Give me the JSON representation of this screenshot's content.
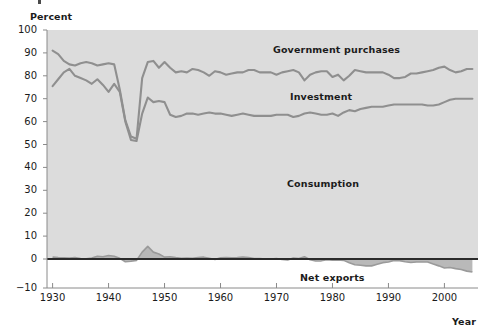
{
  "chart_data": {
    "type": "area",
    "title": "",
    "xlabel": "Year",
    "ylabel": "Percent",
    "xlim": [
      1929,
      2006
    ],
    "ylim": [
      -10,
      100
    ],
    "grid": false,
    "legend_position": "inline-annotations",
    "x_ticks": [
      1930,
      1940,
      1950,
      1960,
      1970,
      1980,
      1990,
      2000
    ],
    "y_ticks": [
      -10,
      0,
      10,
      20,
      30,
      40,
      50,
      60,
      70,
      80,
      90,
      100
    ],
    "annotations": [
      "Government purchases",
      "Investment",
      "Consumption",
      "Net exports"
    ],
    "x": [
      1930,
      1931,
      1932,
      1933,
      1934,
      1935,
      1936,
      1937,
      1938,
      1939,
      1940,
      1941,
      1942,
      1943,
      1944,
      1945,
      1946,
      1947,
      1948,
      1949,
      1950,
      1951,
      1952,
      1953,
      1954,
      1955,
      1956,
      1957,
      1958,
      1959,
      1960,
      1961,
      1962,
      1963,
      1964,
      1965,
      1966,
      1967,
      1968,
      1969,
      1970,
      1971,
      1972,
      1973,
      1974,
      1975,
      1976,
      1977,
      1978,
      1979,
      1980,
      1981,
      1982,
      1983,
      1984,
      1985,
      1986,
      1987,
      1988,
      1989,
      1990,
      1991,
      1992,
      1993,
      1994,
      1995,
      1996,
      1997,
      1998,
      1999,
      2000,
      2001,
      2002,
      2003,
      2004,
      2005
    ],
    "series": [
      {
        "name": "Consumption",
        "color": "#8f8f8f",
        "values": [
          75.5,
          78.5,
          81.5,
          83.0,
          80.0,
          79.0,
          78.0,
          76.5,
          78.5,
          76.0,
          73.0,
          76.5,
          73.0,
          60.0,
          52.0,
          51.5,
          63.5,
          70.5,
          68.5,
          69.0,
          68.5,
          63.0,
          62.0,
          62.5,
          63.5,
          63.5,
          63.0,
          63.5,
          64.0,
          63.5,
          63.5,
          63.0,
          62.5,
          63.0,
          63.5,
          63.0,
          62.5,
          62.5,
          62.5,
          62.5,
          63.0,
          63.0,
          63.0,
          62.0,
          62.5,
          63.5,
          64.0,
          63.5,
          63.0,
          63.0,
          63.5,
          62.5,
          64.0,
          65.0,
          64.5,
          65.5,
          66.0,
          66.5,
          66.5,
          66.5,
          67.0,
          67.5,
          67.5,
          67.5,
          67.5,
          67.5,
          67.5,
          67.0,
          67.0,
          67.5,
          68.5,
          69.5,
          70.0,
          70.0,
          70.0,
          70.0
        ],
        "cumulative_values": [
          75.5,
          78.5,
          81.5,
          83.0,
          80.0,
          79.0,
          78.0,
          76.5,
          78.5,
          76.0,
          73.0,
          76.5,
          73.0,
          60.0,
          52.0,
          51.5,
          63.5,
          70.5,
          68.5,
          69.0,
          68.5,
          63.0,
          62.0,
          62.5,
          63.5,
          63.5,
          63.0,
          63.5,
          64.0,
          63.5,
          63.5,
          63.0,
          62.5,
          63.0,
          63.5,
          63.0,
          62.5,
          62.5,
          62.5,
          62.5,
          63.0,
          63.0,
          63.0,
          62.0,
          62.5,
          63.5,
          64.0,
          63.5,
          63.0,
          63.0,
          63.5,
          62.5,
          64.0,
          65.0,
          64.5,
          65.5,
          66.0,
          66.5,
          66.5,
          66.5,
          67.0,
          67.5,
          67.5,
          67.5,
          67.5,
          67.5,
          67.5,
          67.0,
          67.0,
          67.5,
          68.5,
          69.5,
          70.0,
          70.0,
          70.0,
          70.0
        ]
      },
      {
        "name": "Investment",
        "color": "#8f8f8f",
        "cumulative_top": [
          91.0,
          89.5,
          86.5,
          85.0,
          84.5,
          85.5,
          86.0,
          85.5,
          84.5,
          85.0,
          85.5,
          85.0,
          74.0,
          60.5,
          53.5,
          52.5,
          79.0,
          86.0,
          86.5,
          83.5,
          86.0,
          83.5,
          81.5,
          82.0,
          81.5,
          83.0,
          82.5,
          81.5,
          80.0,
          82.0,
          81.5,
          80.5,
          81.0,
          81.5,
          81.5,
          82.5,
          82.5,
          81.5,
          81.5,
          81.5,
          80.5,
          81.5,
          82.0,
          82.5,
          81.5,
          78.0,
          80.5,
          81.5,
          82.0,
          82.0,
          79.5,
          80.5,
          78.0,
          80.0,
          82.5,
          82.0,
          81.5,
          81.5,
          81.5,
          81.5,
          80.5,
          79.0,
          79.0,
          79.5,
          81.0,
          81.0,
          81.5,
          82.0,
          82.5,
          83.5,
          84.0,
          82.5,
          81.5,
          82.0,
          83.0,
          83.0
        ]
      },
      {
        "name": "Government purchases",
        "color": "#8f8f8f",
        "note": "region above Investment line up to 100 percent"
      },
      {
        "name": "Net exports",
        "color": "#8f8f8f",
        "values": [
          0.8,
          0.6,
          0.5,
          0.4,
          0.6,
          0.2,
          0.1,
          0.4,
          1.2,
          1.0,
          1.5,
          1.2,
          0.3,
          -1.2,
          -1.0,
          -0.6,
          3.0,
          5.5,
          3.0,
          2.2,
          0.8,
          1.0,
          0.6,
          0.3,
          0.4,
          0.3,
          0.6,
          0.8,
          0.3,
          -0.2,
          0.5,
          0.6,
          0.5,
          0.6,
          0.9,
          0.6,
          0.2,
          0.2,
          0.0,
          0.0,
          0.2,
          -0.2,
          -0.4,
          0.4,
          0.2,
          1.0,
          -0.3,
          -0.9,
          -0.8,
          -0.3,
          -0.5,
          -0.4,
          -0.6,
          -1.6,
          -2.5,
          -2.7,
          -3.0,
          -3.0,
          -2.3,
          -1.6,
          -1.3,
          -0.6,
          -0.7,
          -1.2,
          -1.5,
          -1.3,
          -1.3,
          -1.3,
          -2.2,
          -3.0,
          -3.9,
          -3.7,
          -4.2,
          -4.6,
          -5.3,
          -5.7
        ]
      }
    ]
  },
  "axes": {
    "y_title": "Percent",
    "x_title": "Year",
    "y_tick_labels": [
      "100",
      "90",
      "80",
      "70",
      "60",
      "50",
      "40",
      "30",
      "20",
      "10",
      "0",
      "-10"
    ],
    "x_tick_labels": [
      "1930",
      "1940",
      "1950",
      "1960",
      "1970",
      "1980",
      "1990",
      "2000"
    ]
  },
  "labels": {
    "government": "Government purchases",
    "investment": "Investment",
    "consumption": "Consumption",
    "net_exports": "Net exports"
  },
  "colors": {
    "plot_background": "#dcdcdc",
    "line": "#8f8f8f",
    "zero_line": "#2b2b2b",
    "axis": "#8a8a8a",
    "text": "#1b1b1b"
  }
}
